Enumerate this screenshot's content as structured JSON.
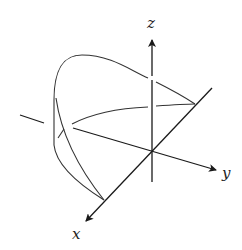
{
  "figure": {
    "type": "3d-coordinate-sketch",
    "axes": {
      "x": {
        "label": "x"
      },
      "y": {
        "label": "y"
      },
      "z": {
        "label": "z"
      }
    },
    "colors": {
      "axis": "#1a1a1a",
      "curve": "#333333",
      "background": "#ffffff"
    }
  }
}
